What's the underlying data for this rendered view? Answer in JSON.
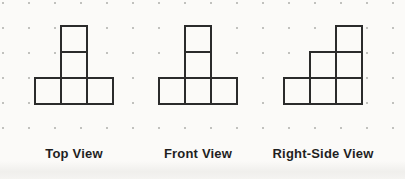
{
  "page": {
    "background_color": "#fbfaf8",
    "width": 405,
    "height": 179
  },
  "grid": {
    "origin_x": 3,
    "origin_y": 3,
    "cols": 16,
    "rows": 6,
    "dx": 26,
    "dy": 25,
    "dot_r": 1,
    "dot_color": "#aeaeab"
  },
  "figure_style": {
    "cell": 26,
    "top": 26,
    "stroke": "#2b2b2b",
    "stroke_width": 2,
    "fill": "#fbfaf8"
  },
  "figures": [
    {
      "label": "Top View",
      "x": 35,
      "cells": [
        [
          1,
          0
        ],
        [
          1,
          1
        ],
        [
          0,
          2
        ],
        [
          1,
          2
        ],
        [
          2,
          2
        ]
      ]
    },
    {
      "label": "Front View",
      "x": 159,
      "cells": [
        [
          1,
          0
        ],
        [
          1,
          1
        ],
        [
          0,
          2
        ],
        [
          1,
          2
        ],
        [
          2,
          2
        ]
      ]
    },
    {
      "label": "Right-Side View",
      "x": 284,
      "cells": [
        [
          2,
          0
        ],
        [
          1,
          1
        ],
        [
          2,
          1
        ],
        [
          0,
          2
        ],
        [
          1,
          2
        ],
        [
          2,
          2
        ]
      ]
    }
  ],
  "labels": {
    "top": 146
  }
}
